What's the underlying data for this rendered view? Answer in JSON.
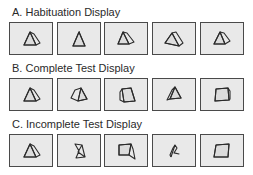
{
  "figure": {
    "rows": [
      {
        "label": "A. Habituation Display",
        "panels": [
          {
            "shape": "prism-rotated-left"
          },
          {
            "shape": "prism-front"
          },
          {
            "shape": "prism-rotated-right"
          },
          {
            "shape": "prism-wide-right"
          },
          {
            "shape": "prism-rotated-right-2"
          }
        ]
      },
      {
        "label": "B. Complete Test Display",
        "panels": [
          {
            "shape": "prism-rotated-left"
          },
          {
            "shape": "prism-wide-left"
          },
          {
            "shape": "quad-prism"
          },
          {
            "shape": "prism-thin-left"
          },
          {
            "shape": "square-face"
          }
        ]
      },
      {
        "label": "C. Incomplete Test Display",
        "panels": [
          {
            "shape": "prism-rotated-left"
          },
          {
            "shape": "fragment-bowtie"
          },
          {
            "shape": "fragment-quad-tail"
          },
          {
            "shape": "fragment-thin"
          },
          {
            "shape": "square-face"
          }
        ]
      }
    ],
    "colors": {
      "border": "#4a4a4a",
      "panel_fill": "#e9e9e9",
      "stroke": "#2b2b2b",
      "text": "#2a2a2a"
    }
  }
}
